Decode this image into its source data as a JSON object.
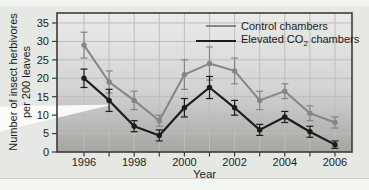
{
  "figure": {
    "y_label_line1": "Number of insect herbivores",
    "y_label_line2": "per 200 leaves"
  },
  "legend": {
    "control": "Control chambers",
    "elevated_prefix": "Elevated CO",
    "elevated_sub": "2",
    "elevated_suffix": " chambers"
  },
  "colors": {
    "control_line": "#858583",
    "elevated_line": "#1c1c1c",
    "plot_bg_top": "#ebebe9",
    "plot_bg_bottom": "#a5a5a2",
    "gridline": "#bdbdbb",
    "frame": "#3b3b3b",
    "text": "#222222"
  },
  "chart_data": {
    "type": "line",
    "title": "",
    "xlabel": "Year",
    "ylabel": "Number of insect herbivores per 200 leaves",
    "x": [
      1996,
      1997,
      1998,
      1999,
      2000,
      2001,
      2002,
      2003,
      2004,
      2005,
      2006
    ],
    "x_tick_labels": [
      "1996",
      "1998",
      "2000",
      "2002",
      "2004",
      "2006"
    ],
    "x_tick_years": [
      1996,
      1998,
      2000,
      2002,
      2004,
      2006
    ],
    "y_ticks": [
      0,
      5,
      10,
      15,
      20,
      25,
      30,
      35
    ],
    "ylim": [
      0,
      35
    ],
    "grid": true,
    "legend_position": "top-right",
    "error_bars": true,
    "series": [
      {
        "name": "Control chambers",
        "color": "#858583",
        "values": [
          29,
          19,
          14,
          8.5,
          21,
          24,
          22,
          14,
          16.5,
          10.5,
          8
        ],
        "errors": [
          3.5,
          3,
          2.5,
          1.5,
          4,
          4.5,
          3.5,
          2.5,
          2,
          2,
          1.5
        ]
      },
      {
        "name": "Elevated CO2 chambers",
        "color": "#1c1c1c",
        "values": [
          20,
          14,
          7,
          4.5,
          12,
          17.5,
          12,
          6,
          9.5,
          5.5,
          2
        ],
        "errors": [
          2.5,
          3,
          1.5,
          1.5,
          2.5,
          3,
          2,
          1.5,
          1.5,
          1.5,
          1
        ]
      }
    ]
  }
}
